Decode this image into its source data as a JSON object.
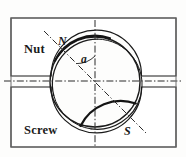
{
  "figure": {
    "width": 186,
    "height": 157,
    "background_color": "#fdfdfc",
    "line_color": "#1a1a1a",
    "centerline_color": "#2a2a2a"
  },
  "labels": {
    "nut": "Nut",
    "screw": "Screw",
    "point_n": "N",
    "point_s": "S",
    "angle": "a"
  },
  "geometry": {
    "outer_frame": {
      "x": 11,
      "y": 18,
      "width": 165,
      "height": 129
    },
    "circle": {
      "cx": 95,
      "cy": 82,
      "r": 45
    },
    "offset_arc": {
      "cx": 98,
      "cy": 84,
      "r": 45
    },
    "vertical_centerline": {
      "x": 95,
      "y1": 20,
      "y2": 146
    },
    "horizontal_centerline": {
      "y": 81,
      "x1": 4,
      "x2": 181
    },
    "axis_ns": {
      "x1": 46,
      "y1": 33,
      "x2": 145,
      "y2": 132
    },
    "angle_value_degrees": 45,
    "angle_arc_radius": 26,
    "nut_block": {
      "x": 11,
      "y": 18,
      "width": 165,
      "height": 58
    },
    "screw_block": {
      "x": 11,
      "y": 88,
      "width": 165,
      "height": 59
    }
  },
  "annotations": {
    "nut_label_pos": {
      "x": 24,
      "y": 49
    },
    "screw_label_pos": {
      "x": 24,
      "y": 130
    },
    "n_label_pos": {
      "x": 57,
      "y": 43
    },
    "s_label_pos": {
      "x": 125,
      "y": 132
    },
    "angle_label_pos": {
      "x": 82,
      "y": 62
    }
  }
}
